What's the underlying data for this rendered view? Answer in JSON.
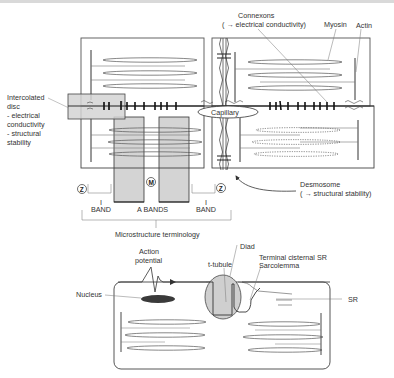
{
  "figure": {
    "type": "cardiac muscle microstructure diagram",
    "colors": {
      "line": "#333333",
      "light_line": "#888888",
      "band_fill": "#d4d4d4",
      "nucleus_fill": "#3a3a3a",
      "diad_fill": "#cfcfcf"
    }
  },
  "upper_panel": {
    "labels": {
      "connexons_line1": "Connexons",
      "connexons_line2": "( → electrical conductivity)",
      "myosin": "Myosin",
      "actin": "Actin",
      "intercalated_disc": [
        "Intercolated",
        "disc",
        "- electrical",
        "conductivity",
        "- structural",
        "stability"
      ],
      "capillary": "Capillary",
      "desmosome_line1": "Desmosome",
      "desmosome_line2": "( → structural stability)"
    },
    "band_markers": {
      "z_left": "Z",
      "m_center": "M",
      "z_right": "Z"
    },
    "band_labels": {
      "i_band_left_tick": "I",
      "i_band_left": "BAND",
      "a_bands": "A BANDS",
      "i_band_right_tick": "I",
      "i_band_right": "BAND"
    },
    "caption": "Microstructure terminology"
  },
  "lower_panel": {
    "labels": {
      "action_potential": [
        "Action",
        "potential"
      ],
      "nucleus": "Nucleus",
      "t_tubule": "t-tubule",
      "diad": "Diad",
      "terminal_cisternal_sr": "Terminal cisternal SR",
      "sarcolemma": "Sarcolemma",
      "sr": "SR"
    }
  }
}
